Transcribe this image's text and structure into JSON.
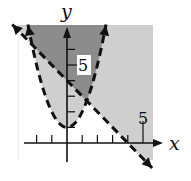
{
  "chart_data": {
    "type": "region",
    "title": "",
    "xlabel": "x",
    "ylabel": "y",
    "xlim": [
      -3.2,
      5.6
    ],
    "ylim": [
      -1.1,
      7.6
    ],
    "grid": false,
    "tick_labels": {
      "x": [
        "5"
      ],
      "y": [
        "5"
      ]
    },
    "x_ticks": [
      -2,
      -1,
      1,
      2,
      3,
      4,
      5
    ],
    "y_ticks": [
      1,
      2,
      3,
      4,
      5,
      6
    ],
    "boundaries": [
      {
        "name": "parabola",
        "equation": "y = x^2 + 1",
        "style": "dashed",
        "vertex": [
          0,
          1
        ]
      },
      {
        "name": "line",
        "equation": "y = -x + 4",
        "style": "dashed",
        "y_intercept": 4,
        "x_intercept": 4
      }
    ],
    "shading": {
      "dark_region": "y > x^2 + 1 and y > -x + 4",
      "light_region": "exactly one of y > x^2 + 1, y > -x + 4",
      "white_region": "y < x^2 + 1 and y < -x + 4"
    },
    "colors": {
      "dark": "#8c8c8c",
      "light": "#cfcfcf",
      "white": "#ffffff",
      "curve": "#111111"
    }
  },
  "labels": {
    "x_axis": "x",
    "y_axis": "y",
    "x_tick": "5",
    "y_tick": "5"
  }
}
